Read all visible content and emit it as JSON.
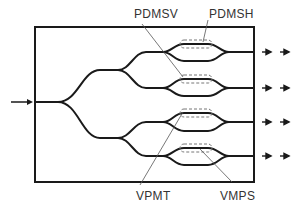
{
  "diagram": {
    "type": "optical waveguide splitter / switch schematic",
    "labels": {
      "pdmsv": "PDMSV",
      "pdmsh": "PDMSH",
      "vpmt": "VPMT",
      "vmps": "VMPS"
    },
    "input_count": 1,
    "output_count": 4,
    "mzi_count": 4,
    "colors": {
      "waveguide": "#1a1a1a",
      "box": "#1a1a1a",
      "dashed_region": "#777777",
      "leader_line": "#555555",
      "label_text": "#333333"
    }
  }
}
